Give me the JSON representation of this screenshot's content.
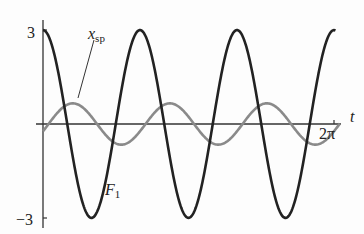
{
  "figure": {
    "y_tick_top": "3",
    "y_tick_bottom": "−3",
    "x_axis_label": "t",
    "x_tick_end": "2π",
    "label_xsp_main": "x",
    "label_xsp_sub": "sp",
    "label_F1_main": "F",
    "label_F1_sub": "1"
  },
  "chart_data": {
    "type": "line",
    "title": "",
    "xlabel": "t",
    "ylabel": "",
    "xlim": [
      0,
      6.2832
    ],
    "ylim": [
      -3,
      3
    ],
    "x_ticks": [
      "2π"
    ],
    "y_ticks": [
      "3",
      "-3"
    ],
    "grid": false,
    "series": [
      {
        "name": "F1",
        "color": "#222222",
        "function": "3cos(3t)",
        "amplitude": 3,
        "cycles": 3
      },
      {
        "name": "x_sp",
        "color": "#888888",
        "function": "approx 1 sin(3t + phase)",
        "amplitude": 1,
        "cycles": 3
      }
    ]
  },
  "colors": {
    "f1": "#222222",
    "xsp": "#8a8a8a",
    "axis": "#333333"
  }
}
